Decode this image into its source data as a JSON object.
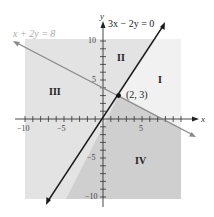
{
  "figure": {
    "axes": {
      "x_label": "x",
      "y_label": "y",
      "x_ticks": [
        "−10",
        "−5",
        "5"
      ],
      "y_ticks": [
        "10",
        "5",
        "−5",
        "−10"
      ],
      "range": [
        -10,
        10
      ]
    },
    "lines": [
      {
        "equation": "3x − 2y = 0",
        "color": "#1a1a1a"
      },
      {
        "equation": "x + 2y = 8",
        "color": "#8a8a8a"
      }
    ],
    "intersection": {
      "label": "(2, 3)",
      "x": 2,
      "y": 3
    },
    "regions": [
      {
        "label": "I",
        "fill": "#f1f1f1"
      },
      {
        "label": "II",
        "fill": "#e3e3e3"
      },
      {
        "label": "III",
        "fill": "#e3e3e3"
      },
      {
        "label": "IV",
        "fill": "#cfcfcf"
      }
    ]
  }
}
